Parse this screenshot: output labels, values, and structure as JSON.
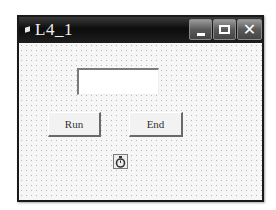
{
  "window": {
    "title": "L4_1",
    "controls": {
      "minimize": "minimize",
      "maximize": "maximize",
      "close": "close"
    }
  },
  "form": {
    "textbox_value": "",
    "buttons": {
      "run_label": "Run",
      "end_label": "End"
    },
    "timer_icon": "stopwatch-icon"
  }
}
